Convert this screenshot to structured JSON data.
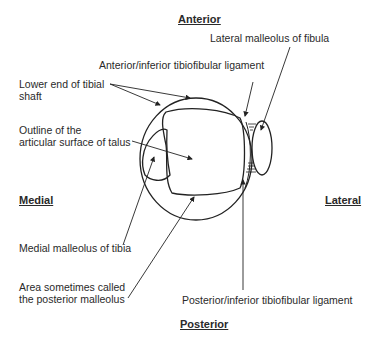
{
  "directions": {
    "anterior": "Anterior",
    "posterior": "Posterior",
    "medial": "Medial",
    "lateral": "Lateral"
  },
  "labels": {
    "lateral_malleolus": "Lateral malleolus of fibula",
    "anterior_ligament": "Anterior/inferior tibiofibular ligament",
    "tibial_shaft_line1": "Lower end of tibial",
    "tibial_shaft_line2": "shaft",
    "talus_line1": "Outline of the",
    "talus_line2": "articular surface of talus",
    "medial_malleolus": "Medial malleolus of tibia",
    "posterior_malleolus_line1": "Area sometimes called",
    "posterior_malleolus_line2": "the posterior malleolus",
    "posterior_ligament": "Posterior/inferior tibiofibular ligament"
  }
}
